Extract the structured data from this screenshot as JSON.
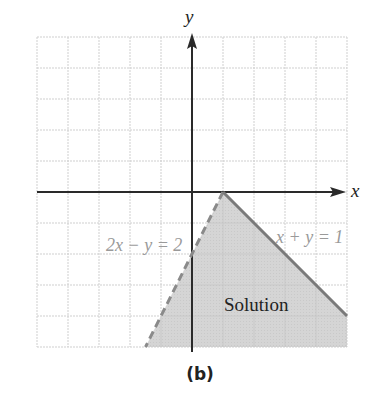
{
  "chart_data": {
    "type": "area",
    "title": "",
    "caption": "(b)",
    "xlabel": "x",
    "ylabel": "y",
    "xlim": [
      -5,
      5
    ],
    "ylim": [
      -5,
      5
    ],
    "grid": true,
    "grid_step": 1,
    "tick_labels_shown": false,
    "lines": [
      {
        "name": "2x − y = 2",
        "equation": "2x - y = 2",
        "style": "dashed",
        "color": "#8a8a8a",
        "points": [
          [
            1,
            0
          ],
          [
            -1.5,
            -5
          ]
        ]
      },
      {
        "name": "x + y = 1",
        "equation": "x + y = 1",
        "style": "solid",
        "color": "#7a7a7a",
        "points": [
          [
            1,
            0
          ],
          [
            5,
            -4
          ]
        ]
      }
    ],
    "shaded_region": {
      "label": "Solution",
      "color": "#cfcfcf",
      "vertices": [
        [
          1,
          0
        ],
        [
          5,
          -4
        ],
        [
          5,
          -5
        ],
        [
          -1.5,
          -5
        ]
      ]
    },
    "annotations": [
      {
        "text": "2x − y = 2",
        "x": -2.8,
        "y": -1.8
      },
      {
        "text": "x + y = 1",
        "x": 3.6,
        "y": -1.4
      },
      {
        "text": "Solution",
        "x": 2.1,
        "y": -3.6
      }
    ]
  },
  "labels": {
    "x_axis": "x",
    "y_axis": "y",
    "dashed_line": "2x − y = 2",
    "solid_line": "x + y = 1",
    "region": "Solution",
    "caption": "(b)"
  }
}
